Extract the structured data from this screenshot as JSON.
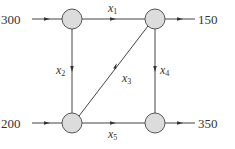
{
  "diagram": {
    "type": "network-flow",
    "colors": {
      "edge": "#444444",
      "node_fill": "#dcdcdc",
      "node_stroke": "#555555",
      "text": "#333333"
    },
    "nodes": [
      {
        "id": "A",
        "position": "top-left"
      },
      {
        "id": "B",
        "position": "top-right"
      },
      {
        "id": "C",
        "position": "bottom-left"
      },
      {
        "id": "D",
        "position": "bottom-right"
      }
    ],
    "external_flows": [
      {
        "label": "300",
        "direction": "in",
        "node": "A"
      },
      {
        "label": "150",
        "direction": "out",
        "node": "B"
      },
      {
        "label": "200",
        "direction": "in",
        "node": "C"
      },
      {
        "label": "350",
        "direction": "out",
        "node": "D"
      }
    ],
    "edges": [
      {
        "var": "x",
        "sub": "1",
        "from": "A",
        "to": "B"
      },
      {
        "var": "x",
        "sub": "2",
        "from": "A",
        "to": "C"
      },
      {
        "var": "x",
        "sub": "3",
        "from": "C",
        "to": "B"
      },
      {
        "var": "x",
        "sub": "4",
        "from": "B",
        "to": "D"
      },
      {
        "var": "x",
        "sub": "5",
        "from": "C",
        "to": "D"
      }
    ]
  }
}
